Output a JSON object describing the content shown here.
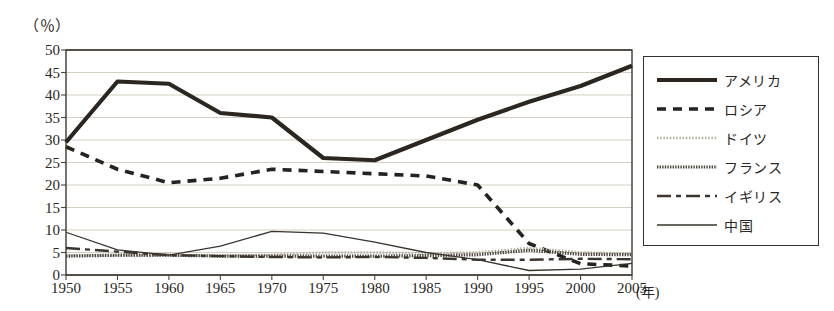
{
  "chart_data": {
    "type": "line",
    "title": "",
    "subtitle": "",
    "xlabel": "(年)",
    "ylabel": "（％）",
    "x": [
      1950,
      1955,
      1960,
      1965,
      1970,
      1975,
      1980,
      1985,
      1990,
      1995,
      2000,
      2005
    ],
    "xtick_labels": [
      "1950",
      "1955",
      "1960",
      "1965",
      "1970",
      "1975",
      "1980",
      "1985",
      "1990",
      "1995",
      "2000",
      "2005"
    ],
    "ytick_labels": [
      "0",
      "5",
      "10",
      "15",
      "20",
      "25",
      "30",
      "35",
      "40",
      "45",
      "50"
    ],
    "ylim": [
      0,
      50
    ],
    "ytick_step": 5,
    "xlim": [
      1950,
      2005
    ],
    "grid": "horizontal",
    "legend_position": "right-outside",
    "series": [
      {
        "name": "アメリカ",
        "style": "thick-solid",
        "color": "#2b2620",
        "width": 4.2,
        "dash": "none",
        "values": [
          29.5,
          43.0,
          42.5,
          36.0,
          35.0,
          26.0,
          25.5,
          30.0,
          34.5,
          38.5,
          42.0,
          46.5
        ]
      },
      {
        "name": "ロシア",
        "style": "thick-dashed",
        "color": "#262220",
        "width": 3.6,
        "dash": "9,7",
        "values": [
          28.5,
          23.5,
          20.5,
          21.5,
          23.5,
          23.0,
          22.5,
          22.0,
          20.0,
          7.0,
          2.5,
          2.0
        ]
      },
      {
        "name": "ドイツ",
        "style": "light-dotted",
        "color": "#b9b6aa",
        "width": 2.6,
        "dash": "1.6,1.6",
        "values": [
          4.3,
          4.3,
          4.3,
          4.3,
          4.5,
          5.0,
          5.0,
          4.8,
          5.0,
          6.0,
          5.0,
          4.8
        ]
      },
      {
        "name": "フランス",
        "style": "dense-dotted-medium",
        "color": "#4b463f",
        "width": 3.2,
        "dash": "1.4,1.2",
        "values": [
          4.2,
          4.4,
          4.4,
          4.2,
          4.2,
          4.2,
          4.2,
          4.3,
          4.5,
          5.5,
          4.6,
          4.5
        ]
      },
      {
        "name": "イギリス",
        "style": "dash-dot",
        "color": "#3a352f",
        "width": 2.4,
        "dash": "14,5,5,5",
        "values": [
          6.0,
          5.2,
          4.4,
          4.2,
          4.0,
          3.9,
          4.0,
          3.8,
          3.4,
          3.4,
          3.6,
          3.5
        ]
      },
      {
        "name": "中国",
        "style": "thin-solid",
        "color": "#38342e",
        "width": 1.3,
        "values": [
          9.5,
          5.6,
          4.4,
          6.4,
          9.7,
          9.3,
          7.3,
          5.0,
          3.4,
          1.0,
          1.3,
          2.6
        ]
      }
    ]
  },
  "axes": {
    "unit_top_left": "（％）",
    "unit_bottom_right": "(年)"
  },
  "legend": {
    "items": [
      {
        "label": "アメリカ",
        "icon": "thick-solid-line-icon"
      },
      {
        "label": "ロシア",
        "icon": "thick-dashed-line-icon"
      },
      {
        "label": "ドイツ",
        "icon": "light-dotted-line-icon"
      },
      {
        "label": "フランス",
        "icon": "dense-dotted-line-icon"
      },
      {
        "label": "イギリス",
        "icon": "dash-dot-line-icon"
      },
      {
        "label": "中国",
        "icon": "thin-solid-line-icon"
      }
    ]
  },
  "colors": {
    "ink": "#2a2724",
    "grid": "#cfcabb",
    "frame": "#4a453d",
    "background": "#ffffff"
  }
}
